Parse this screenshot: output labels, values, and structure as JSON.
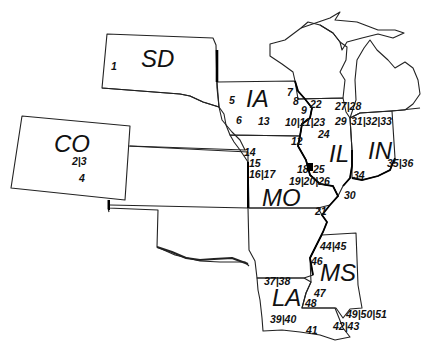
{
  "map": {
    "states": [
      {
        "code": "SD",
        "x": 141,
        "y": 47
      },
      {
        "code": "CO",
        "x": 54,
        "y": 132
      },
      {
        "code": "IA",
        "x": 246,
        "y": 87
      },
      {
        "code": "IL",
        "x": 329,
        "y": 142
      },
      {
        "code": "IN",
        "x": 368,
        "y": 139
      },
      {
        "code": "MO",
        "x": 262,
        "y": 186
      },
      {
        "code": "MS",
        "x": 320,
        "y": 261
      },
      {
        "code": "LA",
        "x": 272,
        "y": 286
      }
    ],
    "sites": [
      {
        "label": "1",
        "x": 111,
        "y": 61
      },
      {
        "label": "2|3",
        "x": 72,
        "y": 156
      },
      {
        "label": "4",
        "x": 79,
        "y": 173
      },
      {
        "label": "5",
        "x": 229,
        "y": 95
      },
      {
        "label": "6",
        "x": 236,
        "y": 115
      },
      {
        "label": "7",
        "x": 287,
        "y": 87
      },
      {
        "label": "8",
        "x": 293,
        "y": 96
      },
      {
        "label": "9",
        "x": 301,
        "y": 105
      },
      {
        "label": "10|11|23",
        "x": 285,
        "y": 117
      },
      {
        "label": "12",
        "x": 291,
        "y": 136
      },
      {
        "label": "13",
        "x": 258,
        "y": 116
      },
      {
        "label": "14",
        "x": 244,
        "y": 147
      },
      {
        "label": "15",
        "x": 249,
        "y": 158
      },
      {
        "label": "16|17",
        "x": 249,
        "y": 169
      },
      {
        "label": "18",
        "x": 297,
        "y": 164
      },
      {
        "label": "19|20|26",
        "x": 289,
        "y": 176
      },
      {
        "label": "21",
        "x": 315,
        "y": 206
      },
      {
        "label": "22",
        "x": 310,
        "y": 99
      },
      {
        "label": "24",
        "x": 318,
        "y": 129
      },
      {
        "label": "25",
        "x": 313,
        "y": 164
      },
      {
        "label": "27|28",
        "x": 335,
        "y": 101
      },
      {
        "label": "29",
        "x": 335,
        "y": 116
      },
      {
        "label": "30",
        "x": 344,
        "y": 190
      },
      {
        "label": "31|32|33",
        "x": 351,
        "y": 116
      },
      {
        "label": "34",
        "x": 353,
        "y": 170
      },
      {
        "label": "35|36",
        "x": 387,
        "y": 158
      },
      {
        "label": "37|38",
        "x": 264,
        "y": 276
      },
      {
        "label": "39|40",
        "x": 270,
        "y": 314
      },
      {
        "label": "41",
        "x": 306,
        "y": 325
      },
      {
        "label": "42|43",
        "x": 333,
        "y": 321
      },
      {
        "label": "44|45",
        "x": 320,
        "y": 241
      },
      {
        "label": "46",
        "x": 311,
        "y": 256
      },
      {
        "label": "47",
        "x": 314,
        "y": 288
      },
      {
        "label": "48",
        "x": 305,
        "y": 298
      },
      {
        "label": "49|50|51",
        "x": 346,
        "y": 309
      }
    ],
    "marker": {
      "x": 307,
      "y": 163,
      "w": 6,
      "h": 8,
      "color": "#000000"
    }
  }
}
